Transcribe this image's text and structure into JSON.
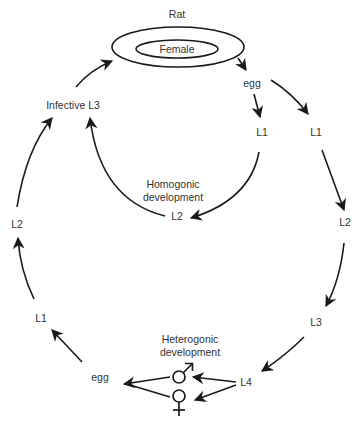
{
  "diagram": {
    "host": {
      "label": "Rat",
      "inner_label": "Female"
    },
    "homogonic": {
      "label_line1": "Homogonic",
      "label_line2": "development",
      "nodes": [
        "egg",
        "L1",
        "L2",
        "Infective L3"
      ]
    },
    "heterogonic": {
      "label_line1": "Heterogonic",
      "label_line2": "development",
      "nodes": [
        "L1",
        "L2",
        "L3",
        "L4",
        "egg",
        "L1",
        "L2"
      ],
      "male_symbol": "♂",
      "female_symbol": "♀"
    },
    "labels": {
      "egg_top": "egg",
      "l1_inner": "L1",
      "l1_outer": "L1",
      "l2_inner": "L2",
      "l2_right": "L2",
      "l3_right": "L3",
      "l4": "L4",
      "egg_bottom": "egg",
      "l1_left": "L1",
      "l2_left": "L2",
      "infective_l3": "Infective L3"
    },
    "colors": {
      "stroke": "#1a1a1a",
      "text": "#333333",
      "background": "#ffffff"
    }
  }
}
